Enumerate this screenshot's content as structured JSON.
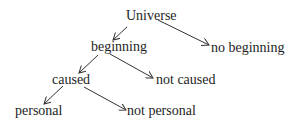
{
  "diagram": {
    "type": "tree",
    "nodes": [
      {
        "id": "universe",
        "label": "Universe",
        "x": 126,
        "y": 9
      },
      {
        "id": "beginning",
        "label": "beginning",
        "x": 91,
        "y": 40
      },
      {
        "id": "no_beginning",
        "label": "no beginning",
        "x": 211,
        "y": 41
      },
      {
        "id": "caused",
        "label": "caused",
        "x": 52,
        "y": 73
      },
      {
        "id": "not_caused",
        "label": "not caused",
        "x": 156,
        "y": 73
      },
      {
        "id": "personal",
        "label": "personal",
        "x": 15,
        "y": 104
      },
      {
        "id": "not_personal",
        "label": "not personal",
        "x": 127,
        "y": 104
      }
    ],
    "edges": [
      {
        "from": "universe",
        "to": "beginning"
      },
      {
        "from": "universe",
        "to": "no_beginning"
      },
      {
        "from": "beginning",
        "to": "caused"
      },
      {
        "from": "beginning",
        "to": "not_caused"
      },
      {
        "from": "caused",
        "to": "personal"
      },
      {
        "from": "caused",
        "to": "not_personal"
      }
    ],
    "colors": {
      "text": "#1e1e1e",
      "arrow": "#333333",
      "background": "#ffffff"
    }
  }
}
